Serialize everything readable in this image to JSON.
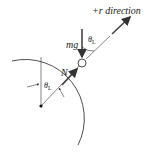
{
  "diagram": {
    "type": "free-body diagram",
    "labels": {
      "direction": "+r direction",
      "weight": "mg",
      "normal": "N",
      "angle_top": "θ",
      "angle_top_sub": "L",
      "angle_center": "θ",
      "angle_center_sub": "L"
    },
    "colors": {
      "line": "#222222",
      "arrow": "#444444",
      "background": "#ffffff"
    }
  }
}
